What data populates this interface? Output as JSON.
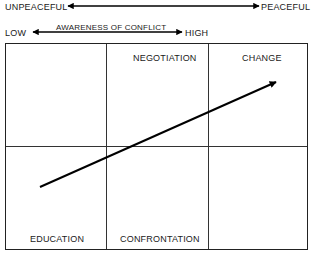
{
  "peace_axis": {
    "left_label": "UNPEACEFUL",
    "right_label": "PEACEFUL"
  },
  "awareness_axis": {
    "title": "AWARENESS OF CONFLICT",
    "left_label": "LOW",
    "right_label": "HIGH"
  },
  "grid": {
    "top_row": [
      "",
      "NEGOTIATION",
      "CHANGE"
    ],
    "bottom_row": [
      "EDUCATION",
      "CONFRONTATION",
      ""
    ]
  },
  "progression_arrow": {
    "from": "EDUCATION",
    "to": "CHANGE",
    "color": "#000000"
  }
}
